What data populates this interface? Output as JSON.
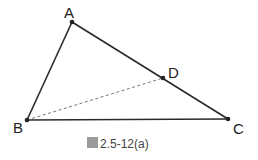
{
  "figure": {
    "caption": "圖 2.5-12(a)",
    "caption_prefix_glyph": "圖",
    "caption_text": "2.5-12(a)",
    "colors": {
      "line": "#2a2a2a",
      "dashed": "#777777",
      "text": "#222222"
    }
  },
  "points": {
    "A": {
      "label": "A",
      "x": 72,
      "y": 22
    },
    "B": {
      "label": "B",
      "x": 27,
      "y": 120
    },
    "C": {
      "label": "C",
      "x": 228,
      "y": 119
    },
    "D": {
      "label": "D",
      "x": 163,
      "y": 78
    }
  },
  "segments": [
    {
      "from": "A",
      "to": "B",
      "style": "solid"
    },
    {
      "from": "A",
      "to": "C",
      "style": "solid"
    },
    {
      "from": "B",
      "to": "C",
      "style": "solid"
    },
    {
      "from": "B",
      "to": "D",
      "style": "dashed"
    }
  ]
}
